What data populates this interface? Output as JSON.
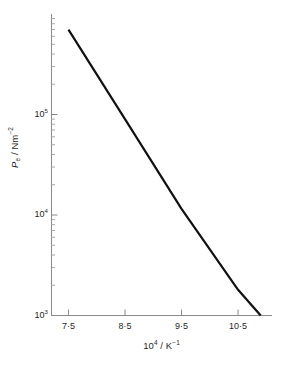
{
  "chart_data": {
    "type": "line",
    "title": "",
    "subtitle": "",
    "xlabel": "10⁴ / K⁻¹",
    "ylabel": "Pₑ / Nm⁻²",
    "ylabel_parts": {
      "symbol": "P",
      "symbol_sub": "e",
      "separator": " / ",
      "unit_base": "Nm",
      "unit_sup": "−2"
    },
    "xlabel_parts": {
      "base": "10",
      "base_sup": "4",
      "separator": " / ",
      "unit_base": "K",
      "unit_sup": "−1"
    },
    "xscale": "linear",
    "yscale": "log",
    "xlim": [
      7.2,
      11.1
    ],
    "ylim": [
      1000,
      1000000
    ],
    "grid": false,
    "legend": null,
    "legend_position": "none",
    "xticks": [
      7.5,
      8.5,
      9.5,
      10.5
    ],
    "xtick_labels": [
      "7·5",
      "8·5",
      "9·5",
      "10·5"
    ],
    "yticks": [
      1000,
      10000,
      100000
    ],
    "ytick_labels": [
      "10³",
      "10⁴",
      "10⁵"
    ],
    "ytick_label_parts": [
      {
        "base": "10",
        "sup": "3"
      },
      {
        "base": "10",
        "sup": "4"
      },
      {
        "base": "10",
        "sup": "5"
      }
    ],
    "y_minor_ticks_per_decade": 9,
    "series": [
      {
        "name": "vapour pressure line",
        "color": "#111111",
        "linewidth": 2.2,
        "x": [
          7.5,
          10.9
        ],
        "y": [
          700000,
          1000
        ],
        "points": [
          {
            "x": 7.5,
            "y": 700000
          },
          {
            "x": 8.5,
            "y": 90000
          },
          {
            "x": 9.5,
            "y": 11500
          },
          {
            "x": 10.5,
            "y": 1800
          },
          {
            "x": 10.9,
            "y": 1000
          }
        ]
      }
    ],
    "annotations": []
  },
  "figure": {
    "background_color": "#ffffff",
    "axis_color": "#8a8a8a",
    "line_color": "#111111",
    "text_color": "#1f1f1f"
  }
}
